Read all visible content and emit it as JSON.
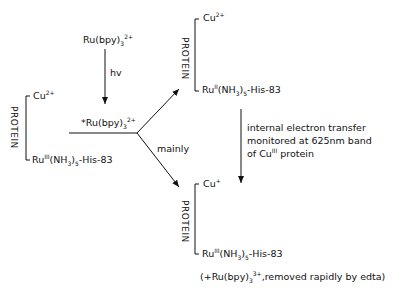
{
  "header_fragment": "",
  "left": {
    "protein_label": "PROTEIN",
    "cu": {
      "base": "Cu",
      "sup": "2+"
    },
    "ru": {
      "base": "Ru",
      "sup": "III",
      "ligand": "(NH",
      "sub": "3",
      "close": ")",
      "sub2": "5",
      "tail": "-His-83"
    }
  },
  "top_reagent": {
    "base": "Ru(bpy)",
    "sub": "3",
    "sup": "2+"
  },
  "hv_label": "hv",
  "excited": {
    "prefix": "*",
    "base": "Ru(bpy)",
    "sub": "3",
    "sup": "2+"
  },
  "mainly_label": "mainly",
  "top_right": {
    "protein_label": "PROTEIN",
    "cu": {
      "base": "Cu",
      "sup": "2+"
    },
    "ru": {
      "base": "Ru",
      "sup": "II",
      "ligand": "(NH",
      "sub": "3",
      "close": ")",
      "sub2": "5",
      "tail": "-His-83"
    }
  },
  "transfer_note": {
    "line1": "internal electron transfer",
    "line2": "monitored at 625nm band",
    "line3_a": "of Cu",
    "line3_sup": "III",
    "line3_b": " protein"
  },
  "bottom_right": {
    "protein_label": "PROTEIN",
    "cu": {
      "base": "Cu",
      "sup": "+"
    },
    "ru": {
      "base": "Ru",
      "sup": "III",
      "ligand": "(NH",
      "sub": "3",
      "close": ")",
      "sub2": "5",
      "tail": "-His-83"
    }
  },
  "footnote": {
    "a": "(+Ru(bpy)",
    "sub": "3",
    "sup": "3+",
    "b": ",removed rapidly by edta)"
  }
}
